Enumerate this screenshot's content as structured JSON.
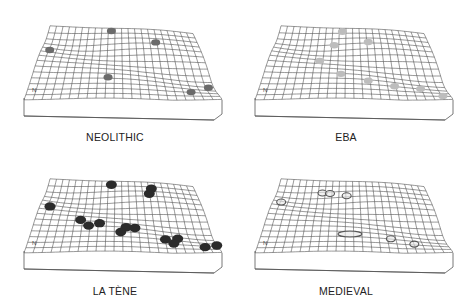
{
  "figure": {
    "panels": [
      {
        "label": "NEOLITHIC",
        "marker_style": "dark-gray",
        "marker_color": "#6b6b6b",
        "sites": [
          [
            0.43,
            0.04
          ],
          [
            0.72,
            0.2
          ],
          [
            0.05,
            0.32
          ],
          [
            0.42,
            0.7
          ],
          [
            0.86,
            0.85
          ],
          [
            0.97,
            0.72
          ]
        ]
      },
      {
        "label": "EBA",
        "marker_style": "light-gray",
        "marker_color": "#bdbdbd",
        "sites": [
          [
            0.43,
            0.05
          ],
          [
            0.6,
            0.2
          ],
          [
            0.38,
            0.22
          ],
          [
            0.3,
            0.45
          ],
          [
            0.43,
            0.65
          ],
          [
            0.58,
            0.73
          ],
          [
            0.72,
            0.78
          ],
          [
            0.86,
            0.78
          ],
          [
            0.96,
            0.92
          ]
        ]
      },
      {
        "label": "LA TÈNE",
        "marker_style": "black",
        "marker_color": "#2b2b2b",
        "sites": [
          [
            0.43,
            0.05
          ],
          [
            0.7,
            0.1
          ],
          [
            0.68,
            0.18
          ],
          [
            0.06,
            0.38
          ],
          [
            0.26,
            0.56
          ],
          [
            0.31,
            0.64
          ],
          [
            0.37,
            0.6
          ],
          [
            0.52,
            0.64
          ],
          [
            0.57,
            0.64
          ],
          [
            0.49,
            0.72
          ],
          [
            0.73,
            0.78
          ],
          [
            0.8,
            0.74
          ],
          [
            0.77,
            0.84
          ],
          [
            0.93,
            0.88
          ],
          [
            1.0,
            0.82
          ]
        ]
      },
      {
        "label": "MEDIEVAL",
        "marker_style": "outline",
        "marker_color": "#555555",
        "sites": [
          [
            0.05,
            0.3
          ],
          [
            0.48,
            0.75
          ],
          [
            0.7,
            0.78
          ],
          [
            0.82,
            0.84
          ],
          [
            0.3,
            0.15
          ],
          [
            0.35,
            0.16
          ],
          [
            0.46,
            0.2
          ]
        ]
      }
    ],
    "north_arrow": "N"
  }
}
